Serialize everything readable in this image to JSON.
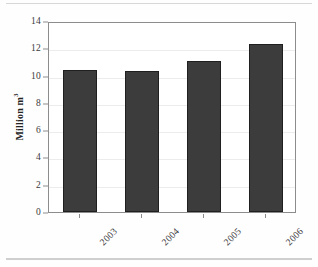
{
  "chart_data": {
    "type": "bar",
    "title": "",
    "subtitle": "",
    "xlabel": "",
    "ylabel": "Million m³",
    "ylabel_base": "Million m",
    "ylabel_exponent": "3",
    "categories": [
      "2003",
      "2004",
      "2005",
      "2006"
    ],
    "values": [
      10.4,
      10.3,
      11.1,
      12.3
    ],
    "series": [
      {
        "name": "",
        "values": [
          10.4,
          10.3,
          11.1,
          12.3
        ]
      }
    ],
    "ylim": [
      0,
      14
    ],
    "y_ticks": [
      0,
      2,
      4,
      6,
      8,
      10,
      12,
      14
    ],
    "y_tick_labels": [
      "0",
      "2",
      "4",
      "6",
      "8",
      "10",
      "12",
      "14"
    ],
    "grid": true,
    "grid_axis": "y",
    "legend": false,
    "legend_position": "none",
    "bar_color": "#3c3c3c",
    "bar_edge_color": "#1f1f1f",
    "grid_color": "#ececec",
    "frame_color": "#8c8c8c",
    "background_color": "#ffffff",
    "x_tick_label_rotation": -45,
    "annotations": []
  }
}
